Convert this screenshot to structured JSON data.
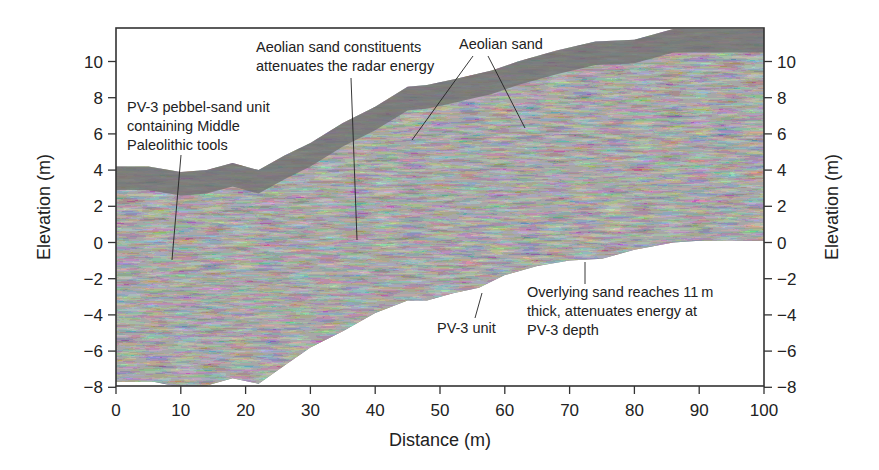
{
  "chart_data": {
    "type": "area",
    "title": "",
    "xlabel": "Distance (m)",
    "ylabel_left": "Elevation (m)",
    "ylabel_right": "Elevation (m)",
    "xlim": [
      0,
      100
    ],
    "ylim": [
      -8,
      11.8
    ],
    "xticks": [
      0,
      10,
      20,
      30,
      40,
      50,
      60,
      70,
      80,
      90,
      100
    ],
    "yticks": [
      10,
      8,
      6,
      4,
      2,
      0,
      -2,
      -4,
      -6,
      -8
    ],
    "ytick_labels": [
      "10",
      "8",
      "6",
      "4",
      "2",
      "0",
      "−2",
      "−4",
      "−6",
      "−8"
    ],
    "grid": false,
    "legend": null,
    "series": [
      {
        "name": "Top surface (ground)",
        "x": [
          0,
          5,
          10,
          14,
          18,
          22,
          26,
          30,
          35,
          40,
          45,
          48,
          52,
          58,
          62,
          68,
          74,
          80,
          86,
          90,
          95,
          100
        ],
        "values": [
          4.2,
          4.2,
          3.9,
          4.0,
          4.4,
          4.0,
          4.8,
          5.5,
          6.6,
          7.5,
          8.6,
          8.7,
          9.0,
          9.5,
          10.0,
          10.6,
          11.1,
          11.2,
          11.8,
          11.8,
          11.8,
          11.8
        ]
      },
      {
        "name": "Bottom (radar penetration limit)",
        "x": [
          0,
          6,
          10,
          14,
          18,
          22,
          26,
          30,
          35,
          40,
          45,
          48,
          52,
          56,
          60,
          65,
          70,
          75,
          80,
          86,
          90,
          95,
          100
        ],
        "values": [
          -7.7,
          -7.7,
          -8.0,
          -7.9,
          -7.5,
          -7.8,
          -6.8,
          -5.8,
          -4.9,
          -3.9,
          -3.2,
          -3.2,
          -2.8,
          -2.5,
          -1.8,
          -1.3,
          -1.0,
          -0.9,
          -0.4,
          0.0,
          0.1,
          0.1,
          0.1
        ]
      }
    ],
    "annotations": [
      {
        "id": "pv3-pebble",
        "lines": [
          "PV-3 pebbel-sand unit",
          "containing Middle",
          "Paleolithic tools"
        ],
        "pointer_to": {
          "x": 8.7,
          "y": -1.0
        }
      },
      {
        "id": "aeolian-attenuates",
        "lines": [
          "Aeolian sand constituents",
          "attenuates the radar energy"
        ],
        "pointer_to": {
          "x": 37.5,
          "y": 0.1
        }
      },
      {
        "id": "aeolian-sand",
        "lines": [
          "Aeolian sand"
        ],
        "pointer_to": [
          {
            "x": 45.5,
            "y": 6.2
          },
          {
            "x": 62.5,
            "y": 6.6
          }
        ]
      },
      {
        "id": "pv3-unit",
        "lines": [
          "PV-3 unit"
        ],
        "pointer_to": {
          "x": 56.3,
          "y": -2.6
        }
      },
      {
        "id": "overlying-sand",
        "lines": [
          "Overlying sand reaches 11 m",
          "thick, attenuates energy at",
          "PV-3 depth"
        ],
        "pointer_to": {
          "x": 73.3,
          "y": -0.6
        }
      }
    ]
  },
  "colors": {
    "radar_fill": "#6b6b6b",
    "radar_dark": "#2a2a2a",
    "radar_light": "#bdbdbd",
    "frame": "#333333",
    "text": "#222222",
    "background": "#ffffff"
  }
}
